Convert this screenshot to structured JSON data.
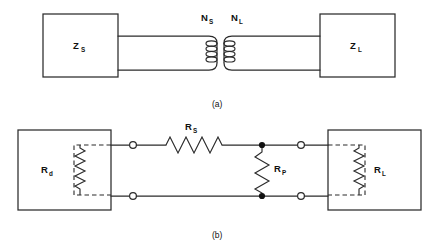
{
  "figure": {
    "type": "circuit-schematic",
    "line_color": "#2b2b2b",
    "label_color": "#111111",
    "background": "#ffffff"
  },
  "panel_a": {
    "caption": "(a)",
    "source_box": {
      "symbol": "Z",
      "subscript": "S"
    },
    "load_box": {
      "symbol": "Z",
      "subscript": "L"
    },
    "primary_winding": {
      "symbol": "N",
      "subscript": "S",
      "turns": 4
    },
    "secondary_winding": {
      "symbol": "N",
      "subscript": "L",
      "turns": 4
    }
  },
  "panel_b": {
    "caption": "(b)",
    "source_box": {
      "symbol": "R",
      "subscript": "d"
    },
    "load_box": {
      "symbol": "R",
      "subscript": "L"
    },
    "series_resistor": {
      "symbol": "R",
      "subscript": "S",
      "orientation": "horizontal"
    },
    "shunt_resistor": {
      "symbol": "R",
      "subscript": "P",
      "orientation": "vertical"
    },
    "terminals": {
      "count": 4,
      "style": "open-circle"
    },
    "junctions": {
      "count": 2,
      "style": "filled-dot"
    }
  }
}
